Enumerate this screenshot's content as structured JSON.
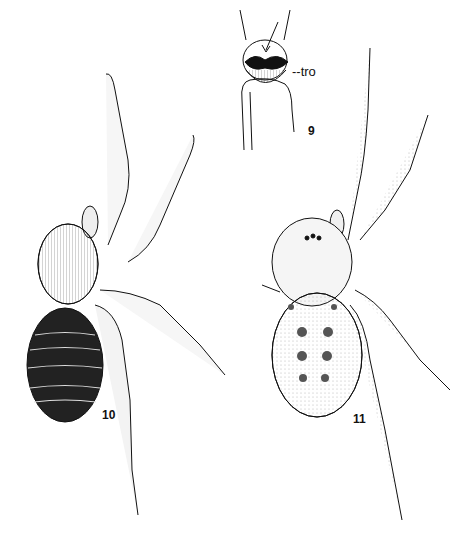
{
  "plate": {
    "description": "Pen-and-ink natural history plate of spiders (dorsal views) with a detail of a leg segment",
    "background": "#ffffff",
    "ink": "#111111"
  },
  "figures": [
    {
      "number": "9",
      "subject": "leg joint detail with trochanter notch",
      "annotation": "--tro"
    },
    {
      "number": "10",
      "subject": "spider dorsal view, banded dark abdomen"
    },
    {
      "number": "11",
      "subject": "spider dorsal view, spotted abdomen"
    }
  ],
  "labels": {
    "fig9": "9",
    "fig10": "10",
    "fig11": "11",
    "tro": "--tro"
  }
}
